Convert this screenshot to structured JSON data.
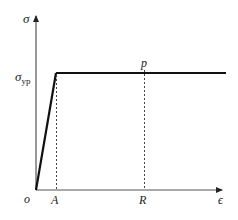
{
  "diagram": {
    "axes": {
      "y_label": "σ",
      "x_label": "ϵ",
      "origin_label": "o"
    },
    "yield_label": {
      "main": "σ",
      "subscript": "yp"
    },
    "points": {
      "A": "A",
      "R": "R",
      "p": "p"
    },
    "colors": {
      "curve": "#111111",
      "axis": "#555555",
      "dashed": "#444444"
    }
  }
}
